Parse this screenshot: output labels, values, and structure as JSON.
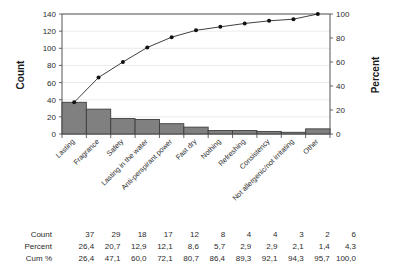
{
  "chart_data": {
    "type": "bar",
    "title": "",
    "subtitle": "",
    "xlabel": "",
    "ylabel": "Count",
    "y2label": "Percent",
    "ylim": [
      0,
      140
    ],
    "y2lim": [
      0,
      100
    ],
    "yticks": [
      0,
      20,
      40,
      60,
      80,
      100,
      120,
      140
    ],
    "y2ticks": [
      0,
      20,
      40,
      60,
      80,
      100
    ],
    "grid": true,
    "legend": "none",
    "categories": [
      "Lasting",
      "Fragrance",
      "Safety",
      "Lasting in the water",
      "Anti-perspirant power",
      "Fast dry",
      "Nothing",
      "Refreshing",
      "Consistency",
      "Not allergenic/not irritating",
      "Other"
    ],
    "values": [
      37,
      29,
      18,
      17,
      12,
      8,
      4,
      4,
      3,
      2,
      6
    ],
    "series": [
      {
        "name": "Count",
        "type": "bar",
        "axis": "left",
        "values": [
          37,
          29,
          18,
          17,
          12,
          8,
          4,
          4,
          3,
          2,
          6
        ]
      },
      {
        "name": "Cum %",
        "type": "line",
        "axis": "right",
        "values": [
          26.4,
          47.1,
          60.0,
          72.1,
          80.7,
          86.4,
          89.3,
          92.1,
          94.3,
          95.7,
          100.0
        ]
      }
    ],
    "colors": {
      "bar_fill": "#808080",
      "bar_stroke": "#3d3d3d",
      "line": "#2a2a2a",
      "marker": "#111111",
      "grid": "#e9e4e4",
      "frame": "#555555"
    }
  },
  "table": {
    "row_labels": [
      "Count",
      "Percent",
      "Cum %"
    ],
    "rows": [
      [
        "37",
        "29",
        "18",
        "17",
        "12",
        "8",
        "4",
        "4",
        "3",
        "2",
        "6"
      ],
      [
        "26,4",
        "20,7",
        "12,9",
        "12,1",
        "8,6",
        "5,7",
        "2,9",
        "2,9",
        "2,1",
        "1,4",
        "4,3"
      ],
      [
        "26,4",
        "47,1",
        "60,0",
        "72,1",
        "80,7",
        "86,4",
        "89,3",
        "92,1",
        "94,3",
        "95,7",
        "100,0"
      ]
    ]
  },
  "axes": {
    "left_title": "Count",
    "right_title": "Percent",
    "left_ticks": [
      "0",
      "20",
      "40",
      "60",
      "80",
      "100",
      "120",
      "140"
    ],
    "right_ticks": [
      "0",
      "20",
      "40",
      "60",
      "80",
      "100"
    ]
  }
}
